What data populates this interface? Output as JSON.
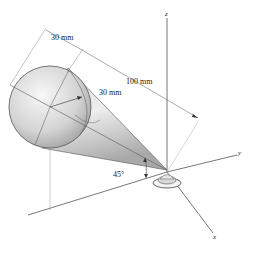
{
  "figure": {
    "type": "3D engineering diagram",
    "colors": {
      "line": "#555555",
      "shade_light": "#f2f2f2",
      "shade_dark": "#9a9a9a",
      "background": "#ffffff"
    }
  },
  "axes": {
    "x": "x",
    "y": "y",
    "z": "z"
  },
  "dimensions": {
    "sphere_width": "30 mm",
    "sphere_radius": "30 mm",
    "cone_length": "100 mm",
    "angle": "45°"
  }
}
